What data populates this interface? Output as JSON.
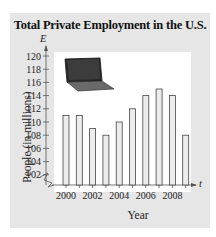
{
  "chart_data": {
    "type": "bar",
    "title": "Total Private Employment in the U.S.",
    "xlabel": "Year",
    "ylabel": "People (in millions)",
    "x_axis_variable": "t",
    "y_axis_variable": "E",
    "categories": [
      "2000",
      "2001",
      "2002",
      "2003",
      "2004",
      "2005",
      "2006",
      "2007",
      "2008",
      "2009"
    ],
    "values": [
      111,
      111,
      109,
      108,
      110,
      112,
      114,
      115,
      114,
      108
    ],
    "x_tick_labels": [
      "2000",
      "2002",
      "2004",
      "2006",
      "2008"
    ],
    "y_tick_labels": [
      "102",
      "104",
      "106",
      "108",
      "110",
      "112",
      "114",
      "116",
      "118",
      "120"
    ],
    "ylim": [
      100,
      121
    ],
    "y_axis_break": true,
    "grid": false,
    "legend": null,
    "decoration": "laptop-image"
  },
  "colors": {
    "card_background": "#e6e6e6",
    "plot_background": "#ffffff",
    "bar_fill": "#ececec",
    "bar_stroke": "#444444",
    "axis": "#555555",
    "text": "#222222"
  }
}
